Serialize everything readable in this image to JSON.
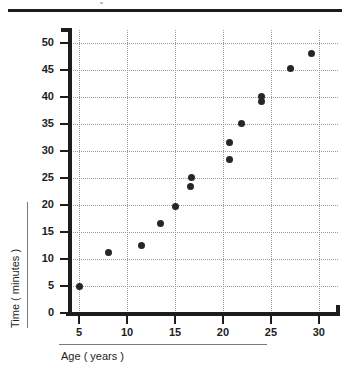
{
  "figure": {
    "top_rule": "horizontal-rule",
    "background_color": "#ffffff",
    "ink_color": "#1d1d1d",
    "grid_color": "#9a9a9a",
    "marker_color": "#262626"
  },
  "chart_data": {
    "type": "scatter",
    "title": "",
    "xlabel": "Age ( years )",
    "ylabel": "Time ( minutes )",
    "xlim": [
      3,
      32
    ],
    "ylim": [
      0,
      52.5
    ],
    "xticks": [
      5,
      10,
      15,
      20,
      25,
      30
    ],
    "xtick_labels": [
      "5",
      "10",
      "15",
      "20",
      "25",
      "30"
    ],
    "yticks": [
      0,
      5,
      10,
      15,
      20,
      25,
      30,
      35,
      40,
      45,
      50
    ],
    "ytick_labels": [
      "0",
      "5",
      "10",
      "15",
      "20",
      "25",
      "30",
      "35",
      "40",
      "45",
      "50"
    ],
    "grid": true,
    "grid_style": "dotted",
    "legend": null,
    "legend_position": "none",
    "marker": "circle",
    "series": [
      {
        "name": "Age vs Time",
        "points": [
          {
            "x": 5.0,
            "y": 4.9
          },
          {
            "x": 8.1,
            "y": 11.2
          },
          {
            "x": 11.5,
            "y": 12.6
          },
          {
            "x": 13.5,
            "y": 16.6
          },
          {
            "x": 15.0,
            "y": 19.7
          },
          {
            "x": 16.6,
            "y": 23.5
          },
          {
            "x": 16.7,
            "y": 25.1
          },
          {
            "x": 20.7,
            "y": 28.5
          },
          {
            "x": 20.7,
            "y": 31.6
          },
          {
            "x": 21.9,
            "y": 35.1
          },
          {
            "x": 24.0,
            "y": 39.3
          },
          {
            "x": 24.0,
            "y": 40.1
          },
          {
            "x": 27.0,
            "y": 45.4
          },
          {
            "x": 29.2,
            "y": 48.1
          }
        ]
      }
    ]
  }
}
